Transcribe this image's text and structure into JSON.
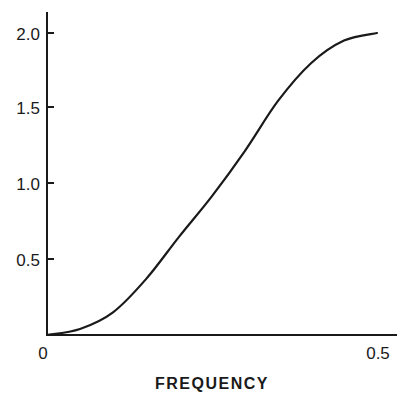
{
  "chart_data": {
    "type": "line",
    "title": "",
    "xlabel": "FREQUENCY",
    "ylabel": "",
    "xlim": [
      0,
      0.5
    ],
    "ylim": [
      0,
      2.0
    ],
    "grid": false,
    "legend": null,
    "x_tick_labels": [
      "0",
      "0.5"
    ],
    "y_tick_labels": [
      "0.5",
      "1.0",
      "1.5",
      "2.0"
    ],
    "series": [
      {
        "name": "response",
        "x": [
          0,
          0.05,
          0.1,
          0.15,
          0.2,
          0.25,
          0.3,
          0.35,
          0.4,
          0.45,
          0.5
        ],
        "y": [
          0,
          0.04,
          0.15,
          0.37,
          0.65,
          0.92,
          1.22,
          1.55,
          1.8,
          1.95,
          2.0
        ]
      }
    ]
  },
  "labels": {
    "x_axis_title": "FREQUENCY",
    "x_tick_0": "0",
    "x_tick_1": "0.5",
    "y_tick_05": "0.5",
    "y_tick_10": "1.0",
    "y_tick_15": "1.5",
    "y_tick_20": "2.0"
  },
  "colors": {
    "line": "#1a1a1a",
    "background": "#ffffff"
  }
}
